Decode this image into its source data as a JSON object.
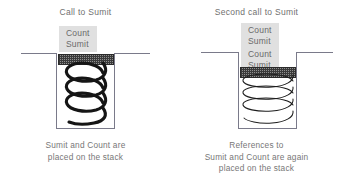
{
  "diagram": {
    "background_color": "#ffffff",
    "text_color": "#707070",
    "label_box_color": "#e0e0e0",
    "stack_outline_color": "#7a7a8a",
    "frame_bar_color": "#3a3a3a",
    "panels": [
      {
        "id": "first-call",
        "title": "Call to Sumit",
        "label_boxes": [
          {
            "rows": [
              "Count",
              "Sumit"
            ]
          }
        ],
        "caption_lines": [
          "Sumit and Count are",
          "placed on the stack"
        ],
        "spring": {
          "coils": 4,
          "weight": "bold"
        }
      },
      {
        "id": "second-call",
        "title": "Second call to Sumit",
        "label_boxes": [
          {
            "rows": [
              "Count",
              "Sumit"
            ]
          },
          {
            "rows": [
              "Count",
              "Sumit"
            ]
          }
        ],
        "caption_lines": [
          "References to",
          "Sumit and Count are again",
          "placed on the stack"
        ],
        "spring": {
          "coils": 4,
          "weight": "thin"
        }
      }
    ]
  }
}
